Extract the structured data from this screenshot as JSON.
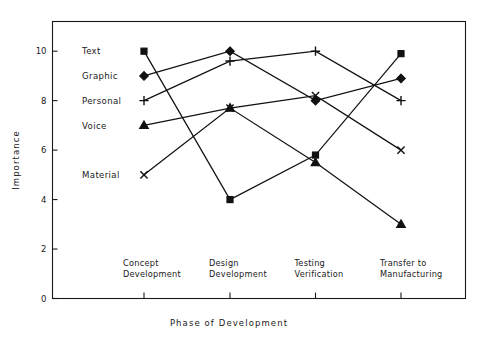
{
  "chart_data": {
    "type": "line",
    "title": "",
    "xlabel": "Phase of Development",
    "ylabel": "Importance",
    "categories": [
      "Concept Development",
      "Design Development",
      "Testing Verification",
      "Transfer to Manufacturing"
    ],
    "category_lines": [
      [
        "Concept",
        "Development"
      ],
      [
        "Design",
        "Development"
      ],
      [
        "Testing",
        "Verification"
      ],
      [
        "Transfer to",
        "Manufacturing"
      ]
    ],
    "ylim": [
      0,
      11.2
    ],
    "yticks": [
      0,
      2,
      4,
      6,
      8,
      10
    ],
    "ytick_labels": [
      "0",
      "2",
      "4",
      "6",
      "8",
      "10"
    ],
    "grid": false,
    "legend_position": "inline-left-of-first-point",
    "series": [
      {
        "name": "Text",
        "marker": "square",
        "values": [
          10.0,
          4.0,
          5.8,
          9.9
        ]
      },
      {
        "name": "Graphic",
        "marker": "diamond",
        "values": [
          9.0,
          10.0,
          8.0,
          8.9
        ]
      },
      {
        "name": "Personal",
        "marker": "plus",
        "values": [
          8.0,
          9.6,
          10.0,
          8.0
        ]
      },
      {
        "name": "Voice",
        "marker": "triangle",
        "values": [
          7.0,
          7.7,
          5.5,
          3.0
        ]
      },
      {
        "name": "Material",
        "marker": "cross",
        "values": [
          5.0,
          7.7,
          8.2,
          6.0
        ]
      }
    ]
  }
}
